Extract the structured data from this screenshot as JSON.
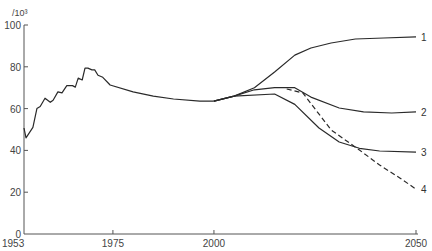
{
  "chart_data": {
    "type": "line",
    "title": "",
    "xlabel": "",
    "ylabel": "/10³",
    "xlim": [
      1953,
      2050
    ],
    "ylim": [
      0,
      100
    ],
    "grid": false,
    "legend": "inline-right",
    "x_ticks": [
      {
        "value": 1953,
        "label": "1953"
      },
      {
        "value": 1975,
        "label": "1975"
      },
      {
        "value": 2000,
        "label": "2000"
      },
      {
        "value": 2050,
        "label": "2050"
      }
    ],
    "y_ticks": [
      {
        "value": 0,
        "label": "0"
      },
      {
        "value": 20,
        "label": "20"
      },
      {
        "value": 40,
        "label": "40"
      },
      {
        "value": 60,
        "label": "60"
      },
      {
        "value": 80,
        "label": "80"
      },
      {
        "value": 100,
        "label": "100"
      }
    ],
    "historical": {
      "name": "historical",
      "style": "solid",
      "points": [
        [
          1953,
          50.7
        ],
        [
          1953.5,
          46
        ],
        [
          1955.2,
          51
        ],
        [
          1956.2,
          60
        ],
        [
          1957,
          61
        ],
        [
          1958.2,
          65
        ],
        [
          1959.5,
          63
        ],
        [
          1960.2,
          64
        ],
        [
          1961.4,
          68
        ],
        [
          1962.4,
          67.5
        ],
        [
          1963.6,
          71
        ],
        [
          1965,
          71
        ],
        [
          1965.7,
          70.3
        ],
        [
          1966.4,
          74.6
        ],
        [
          1967.4,
          73.7
        ],
        [
          1968.1,
          79.4
        ],
        [
          1968.8,
          79.4
        ],
        [
          1969.8,
          78.5
        ],
        [
          1970.5,
          78.5
        ],
        [
          1971.3,
          76
        ],
        [
          1972.5,
          75
        ],
        [
          1974.3,
          71.3
        ],
        [
          1980,
          68
        ],
        [
          1985,
          66
        ],
        [
          1990,
          64.6
        ],
        [
          1996.5,
          63.6
        ],
        [
          2000,
          63.6
        ]
      ]
    },
    "series": [
      {
        "name": "1",
        "label": "1",
        "style": "solid",
        "points": [
          [
            2000,
            63.6
          ],
          [
            2005,
            66
          ],
          [
            2010,
            70
          ],
          [
            2015,
            77.5
          ],
          [
            2020,
            85.6
          ],
          [
            2024,
            89
          ],
          [
            2029,
            91.4
          ],
          [
            2035,
            93.3
          ],
          [
            2042,
            93.8
          ],
          [
            2050,
            94.3
          ]
        ]
      },
      {
        "name": "2",
        "label": "2",
        "style": "solid",
        "points": [
          [
            2000,
            63.6
          ],
          [
            2005,
            66
          ],
          [
            2010,
            69
          ],
          [
            2015,
            70
          ],
          [
            2020,
            70
          ],
          [
            2024,
            65.5
          ],
          [
            2031,
            60.3
          ],
          [
            2037,
            58.4
          ],
          [
            2044,
            57.9
          ],
          [
            2050,
            58.4
          ]
        ]
      },
      {
        "name": "3",
        "label": "3",
        "style": "solid",
        "points": [
          [
            2000,
            63.6
          ],
          [
            2005,
            66
          ],
          [
            2015,
            67
          ],
          [
            2020,
            62
          ],
          [
            2026,
            50.7
          ],
          [
            2031,
            44
          ],
          [
            2036,
            41
          ],
          [
            2041,
            39.7
          ],
          [
            2050,
            39.2
          ]
        ]
      },
      {
        "name": "4",
        "label": "4",
        "style": "dashed",
        "points": [
          [
            2018,
            69.4
          ],
          [
            2022,
            67.5
          ],
          [
            2029,
            49.8
          ],
          [
            2036,
            40.2
          ],
          [
            2041,
            33
          ],
          [
            2046,
            26.8
          ],
          [
            2050,
            21.5
          ]
        ]
      }
    ]
  }
}
